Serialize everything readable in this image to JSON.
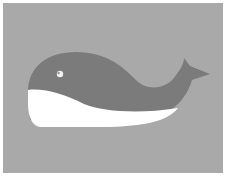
{
  "image": {
    "subject": "whale",
    "style": "flat cartoon illustration",
    "colors": {
      "border": "#ffffff",
      "background": "#a9a9a9",
      "whale_body": "#7b7b7b",
      "whale_belly": "#ffffff",
      "eye": "#f2f2f2",
      "eye_pupil": "#9a9a9a"
    }
  },
  "scene": {
    "elements": [
      {
        "name": "whale-body",
        "color_key": "whale_body"
      },
      {
        "name": "whale-belly",
        "color_key": "whale_belly"
      },
      {
        "name": "whale-tail",
        "color_key": "whale_body"
      },
      {
        "name": "whale-eye",
        "color_key": "eye"
      }
    ]
  }
}
